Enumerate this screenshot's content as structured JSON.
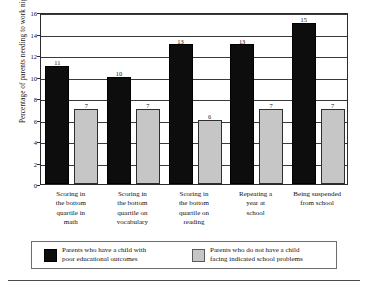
{
  "chart_data": {
    "type": "bar",
    "title": "",
    "xlabel": "",
    "ylabel": "Percentage of parents needing to work nights",
    "ylim": [
      0,
      16
    ],
    "ytick_step": 2,
    "yticks": [
      "0",
      "2",
      "4",
      "6",
      "8",
      "10",
      "12",
      "14",
      "16"
    ],
    "grid": "horizontal",
    "legend_position": "bottom",
    "categories": [
      "Scoring in the bottom quartile in math",
      "Scoring in the bottom quartile on vocabulary",
      "Scoring in the bottom quartile on reading",
      "Repeating a year at school",
      "Being suspended from school"
    ],
    "category_lines": [
      [
        "Scoring in",
        "the bottom",
        "quartile in",
        "math"
      ],
      [
        "Scoring in",
        "the bottom",
        "quartile on",
        "vocabulary"
      ],
      [
        "Scoring in",
        "the bottom",
        "quartile on",
        "reading"
      ],
      [
        "Repeating a",
        "year at",
        "school"
      ],
      [
        "Being suspended",
        "from school"
      ]
    ],
    "series": [
      {
        "name": "Parents who have a child with poor educational outcomes",
        "name_lines": [
          "Parents who have a child with",
          "poor educational outcomes"
        ],
        "color": "#0d0d0d",
        "values": [
          11,
          10,
          13,
          13,
          15
        ],
        "labels": [
          "11",
          "10",
          "13",
          "13",
          "15"
        ]
      },
      {
        "name": "Parents who do not have a child facing indicated school problems",
        "name_lines": [
          "Parents who do not have a child",
          "facing indicated school problems"
        ],
        "color": "#c6c6c6",
        "values": [
          7,
          7,
          6,
          7,
          7
        ],
        "labels": [
          "7",
          "7",
          "6",
          "7",
          "7"
        ]
      }
    ]
  }
}
